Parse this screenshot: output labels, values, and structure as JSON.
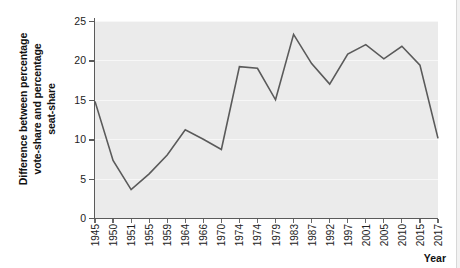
{
  "chart_data": {
    "type": "line",
    "title": "",
    "xlabel": "Year",
    "ylabel": "Difference between percentage vote-share and percentage seat-share",
    "ylabel_lines": [
      "Difference between percentage",
      "vote-share and percentage",
      "seat-share"
    ],
    "categories": [
      "1945",
      "1950",
      "1951",
      "1955",
      "1959",
      "1964",
      "1966",
      "1970",
      "1974",
      "1974",
      "1979",
      "1983",
      "1987",
      "1992",
      "1997",
      "2001",
      "2005",
      "2010",
      "2015",
      "2017"
    ],
    "values": [
      14.8,
      7.3,
      3.6,
      5.6,
      8.0,
      11.2,
      10.0,
      8.7,
      19.2,
      19.0,
      15.0,
      23.3,
      19.6,
      17.0,
      20.8,
      22.0,
      20.2,
      21.8,
      19.4,
      10.1
    ],
    "series": [
      {
        "name": "Difference between percentage vote-share and percentage seat-share",
        "values": [
          14.8,
          7.3,
          3.6,
          5.6,
          8.0,
          11.2,
          10.0,
          8.7,
          19.2,
          19.0,
          15.0,
          23.3,
          19.6,
          17.0,
          20.8,
          22.0,
          20.2,
          21.8,
          19.4,
          10.1
        ]
      }
    ],
    "yticks": [
      0,
      5,
      10,
      15,
      20,
      25
    ],
    "ylim": [
      0,
      25
    ],
    "xlim": [
      0,
      19
    ],
    "grid": true,
    "grid_axis": "y",
    "legend": false,
    "legend_position": "none",
    "line_color": "#5a5a5a",
    "plot_background": "#ebebeb",
    "gridline_color": "#f7f7f7",
    "axis_color": "#5a5a5a",
    "figure_background": "#ffffff"
  }
}
